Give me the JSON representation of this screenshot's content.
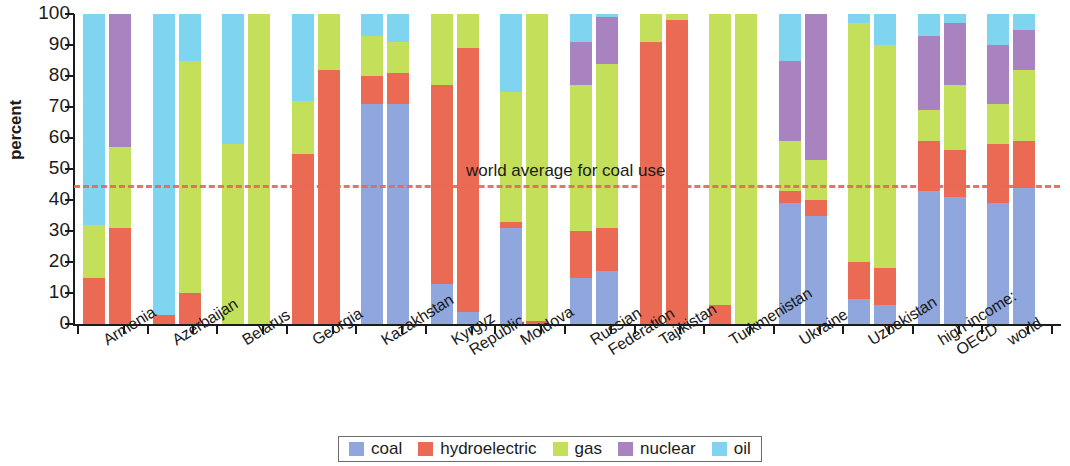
{
  "chart_data": {
    "type": "bar",
    "subtype": "stacked-100-percent-grouped",
    "title": "",
    "xlabel": "",
    "ylabel": "percent",
    "ylim": [
      0,
      100
    ],
    "yticks": [
      0,
      10,
      20,
      30,
      40,
      50,
      60,
      70,
      80,
      90,
      100
    ],
    "grid": false,
    "legend_position": "bottom",
    "legend": [
      {
        "name": "coal",
        "color": "#8fa7dd"
      },
      {
        "name": "hydroelectric",
        "color": "#ea6a54"
      },
      {
        "name": "gas",
        "color": "#c4e05a"
      },
      {
        "name": "nuclear",
        "color": "#a982c0"
      },
      {
        "name": "oil",
        "color": "#7fd4ef"
      }
    ],
    "series_order": [
      "coal",
      "hydroelectric",
      "gas",
      "nuclear",
      "oil"
    ],
    "annotations": [
      {
        "text": "world average for coal use",
        "type": "reference-line",
        "value": 45,
        "color": "#e8685a",
        "style": "dashed"
      }
    ],
    "categories": [
      "Armenia",
      "Azerbaijan",
      "Belarus",
      "Georgia",
      "Kazakhstan",
      "Kyrgyz Republic",
      "Moldova",
      "Russian Federation",
      "Tajikistan",
      "Turkmenistan",
      "Ukraine",
      "Uzbekistan",
      "high income: OECD",
      "world"
    ],
    "category_labels": [
      {
        "line1": "Armenia",
        "line2": ""
      },
      {
        "line1": "Azerbaijan",
        "line2": ""
      },
      {
        "line1": "Belarus",
        "line2": ""
      },
      {
        "line1": "Georgia",
        "line2": ""
      },
      {
        "line1": "Kazakhstan",
        "line2": ""
      },
      {
        "line1": "Kyrgyz",
        "line2": "Republic"
      },
      {
        "line1": "Moldova",
        "line2": ""
      },
      {
        "line1": "Russian",
        "line2": "Federation"
      },
      {
        "line1": "Tajikistan",
        "line2": ""
      },
      {
        "line1": "Turkmenistan",
        "line2": ""
      },
      {
        "line1": "Ukraine",
        "line2": ""
      },
      {
        "line1": "Uzbekistan",
        "line2": ""
      },
      {
        "line1": "high income:",
        "line2": "OECD"
      },
      {
        "line1": "world",
        "line2": ""
      }
    ],
    "bars": [
      {
        "category": "Armenia",
        "bar": 1,
        "coal": 0,
        "hydroelectric": 15,
        "gas": 17,
        "nuclear": 0,
        "oil": 68
      },
      {
        "category": "Armenia",
        "bar": 2,
        "coal": 0,
        "hydroelectric": 31,
        "gas": 26,
        "nuclear": 43,
        "oil": 0
      },
      {
        "category": "Azerbaijan",
        "bar": 1,
        "coal": 0,
        "hydroelectric": 3,
        "gas": 0,
        "nuclear": 0,
        "oil": 97
      },
      {
        "category": "Azerbaijan",
        "bar": 2,
        "coal": 0,
        "hydroelectric": 10,
        "gas": 75,
        "nuclear": 0,
        "oil": 15
      },
      {
        "category": "Belarus",
        "bar": 1,
        "coal": 0,
        "hydroelectric": 0,
        "gas": 58,
        "nuclear": 0,
        "oil": 42
      },
      {
        "category": "Belarus",
        "bar": 2,
        "coal": 0,
        "hydroelectric": 0,
        "gas": 100,
        "nuclear": 0,
        "oil": 0
      },
      {
        "category": "Georgia",
        "bar": 1,
        "coal": 0,
        "hydroelectric": 55,
        "gas": 17,
        "nuclear": 0,
        "oil": 28
      },
      {
        "category": "Georgia",
        "bar": 2,
        "coal": 0,
        "hydroelectric": 82,
        "gas": 18,
        "nuclear": 0,
        "oil": 0
      },
      {
        "category": "Kazakhstan",
        "bar": 1,
        "coal": 71,
        "hydroelectric": 9,
        "gas": 13,
        "nuclear": 0,
        "oil": 7
      },
      {
        "category": "Kazakhstan",
        "bar": 2,
        "coal": 71,
        "hydroelectric": 10,
        "gas": 10,
        "nuclear": 0,
        "oil": 9
      },
      {
        "category": "Kyrgyz Republic",
        "bar": 1,
        "coal": 13,
        "hydroelectric": 64,
        "gas": 23,
        "nuclear": 0,
        "oil": 0
      },
      {
        "category": "Kyrgyz Republic",
        "bar": 2,
        "coal": 4,
        "hydroelectric": 85,
        "gas": 11,
        "nuclear": 0,
        "oil": 0
      },
      {
        "category": "Moldova",
        "bar": 1,
        "coal": 31,
        "hydroelectric": 2,
        "gas": 42,
        "nuclear": 0,
        "oil": 25
      },
      {
        "category": "Moldova",
        "bar": 2,
        "coal": 0,
        "hydroelectric": 1,
        "gas": 99,
        "nuclear": 0,
        "oil": 0
      },
      {
        "category": "Russian Federation",
        "bar": 1,
        "coal": 15,
        "hydroelectric": 15,
        "gas": 47,
        "nuclear": 14,
        "oil": 9
      },
      {
        "category": "Russian Federation",
        "bar": 2,
        "coal": 17,
        "hydroelectric": 14,
        "gas": 53,
        "nuclear": 15,
        "oil": 1
      },
      {
        "category": "Tajikistan",
        "bar": 1,
        "coal": 0,
        "hydroelectric": 91,
        "gas": 9,
        "nuclear": 0,
        "oil": 0
      },
      {
        "category": "Tajikistan",
        "bar": 2,
        "coal": 0,
        "hydroelectric": 98,
        "gas": 2,
        "nuclear": 0,
        "oil": 0
      },
      {
        "category": "Turkmenistan",
        "bar": 1,
        "coal": 0,
        "hydroelectric": 6,
        "gas": 94,
        "nuclear": 0,
        "oil": 0
      },
      {
        "category": "Turkmenistan",
        "bar": 2,
        "coal": 0,
        "hydroelectric": 0,
        "gas": 100,
        "nuclear": 0,
        "oil": 0
      },
      {
        "category": "Ukraine",
        "bar": 1,
        "coal": 39,
        "hydroelectric": 4,
        "gas": 16,
        "nuclear": 26,
        "oil": 15
      },
      {
        "category": "Ukraine",
        "bar": 2,
        "coal": 35,
        "hydroelectric": 5,
        "gas": 13,
        "nuclear": 47,
        "oil": 0
      },
      {
        "category": "Uzbekistan",
        "bar": 1,
        "coal": 8,
        "hydroelectric": 12,
        "gas": 77,
        "nuclear": 0,
        "oil": 3
      },
      {
        "category": "Uzbekistan",
        "bar": 2,
        "coal": 6,
        "hydroelectric": 12,
        "gas": 72,
        "nuclear": 0,
        "oil": 10
      },
      {
        "category": "high income: OECD",
        "bar": 1,
        "coal": 43,
        "hydroelectric": 16,
        "gas": 10,
        "nuclear": 24,
        "oil": 7
      },
      {
        "category": "high income: OECD",
        "bar": 2,
        "coal": 41,
        "hydroelectric": 15,
        "gas": 21,
        "nuclear": 20,
        "oil": 3
      },
      {
        "category": "world",
        "bar": 1,
        "coal": 39,
        "hydroelectric": 19,
        "gas": 13,
        "nuclear": 19,
        "oil": 10
      },
      {
        "category": "world",
        "bar": 2,
        "coal": 44,
        "hydroelectric": 15,
        "gas": 23,
        "nuclear": 13,
        "oil": 5
      }
    ]
  }
}
